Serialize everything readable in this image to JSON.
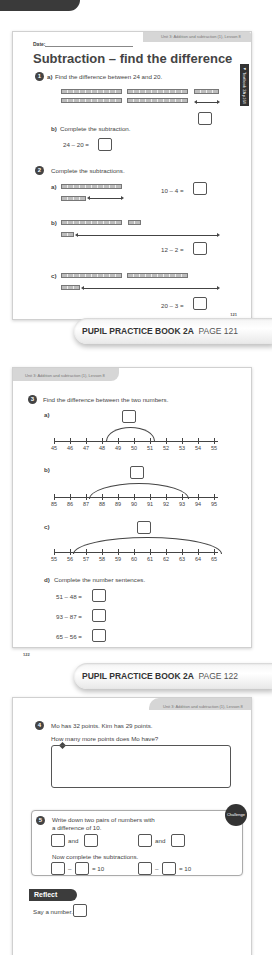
{
  "header_unit": "Unit 3: Addition and subtraction (1), Lesson 8",
  "page1": {
    "date_label": "Date:",
    "title": "Subtraction – find the difference",
    "side_tab": "◄ Textbook 2A p164",
    "q1": {
      "num": "1",
      "a_label": "a)",
      "a_text": "Find the difference between 24 and 20.",
      "b_label": "b)",
      "b_text": "Complete the subtraction.",
      "b_equation": "24 – 20 ="
    },
    "q2": {
      "num": "2",
      "text": "Complete the subtractions.",
      "parts": [
        {
          "label": "a)",
          "equation": "10 – 4 ="
        },
        {
          "label": "b)",
          "equation": "12 – 2 ="
        },
        {
          "label": "c)",
          "equation": "20 – 3 ="
        }
      ]
    },
    "page_number": "121"
  },
  "banner1": {
    "book": "PUPIL PRACTICE BOOK 2A",
    "page": "PAGE 121"
  },
  "page2": {
    "q3": {
      "num": "3",
      "text": "Find the difference between the two numbers.",
      "a_label": "a)",
      "a_ticks": [
        "45",
        "46",
        "47",
        "48",
        "49",
        "50",
        "51",
        "52",
        "53",
        "54",
        "55"
      ],
      "b_label": "b)",
      "b_ticks": [
        "85",
        "86",
        "87",
        "88",
        "89",
        "90",
        "91",
        "92",
        "93",
        "94",
        "95"
      ],
      "c_label": "c)",
      "c_ticks": [
        "55",
        "56",
        "57",
        "58",
        "59",
        "60",
        "61",
        "62",
        "63",
        "64",
        "65"
      ],
      "d_label": "d)",
      "d_text": "Complete the number sentences.",
      "d_equations": [
        "51 – 48 =",
        "93 – 87 =",
        "65 – 56 ="
      ]
    },
    "page_number": "122"
  },
  "banner2": {
    "book": "PUPIL PRACTICE BOOK 2A",
    "page": "PAGE 122"
  },
  "page3": {
    "q4": {
      "num": "4",
      "line1": "Mo has 32 points. Kim has 29 points.",
      "line2": "How many more points does Mo have?"
    },
    "q5": {
      "num": "5",
      "line1": "Write down two pairs of numbers with",
      "line2": "a difference of 10.",
      "and": "and",
      "now_text": "Now complete the subtractions.",
      "minus": "–",
      "equals_ten": "= 10",
      "badge": "Challenge"
    },
    "reflect": {
      "label": "Reflect",
      "text": "Say a number."
    }
  }
}
